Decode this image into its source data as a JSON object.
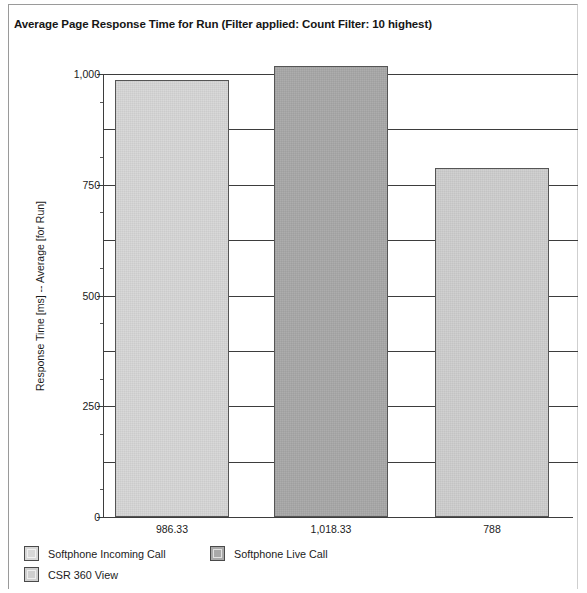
{
  "panel": {
    "title": "Average Page Response Time for Run (Filter applied: Count Filter: 10 highest)"
  },
  "chart_data": {
    "type": "bar",
    "title": "Average Page Response Time for Run (Filter applied: Count Filter: 10 highest)",
    "xlabel": "",
    "ylabel": "Response Time [ms] -- Average [for Run]",
    "categories": [
      "Softphone Incoming Call",
      "Softphone Live Call",
      "CSR 360 View"
    ],
    "values": [
      986.33,
      1018.33,
      788
    ],
    "value_labels": [
      "986.33",
      "1,018.33",
      "788"
    ],
    "colors": [
      "#d7d7d7",
      "#a9a9a9",
      "#cfcfcf"
    ],
    "ylim": [
      0,
      1062
    ],
    "y_ticks": [
      0,
      250,
      500,
      750,
      1000
    ],
    "y_tick_labels": [
      "0",
      "250",
      "500",
      "750",
      "1,000"
    ],
    "gridlines": [
      125,
      250,
      375,
      500,
      625,
      750,
      875,
      1000
    ],
    "minor_ticks": [
      62.5,
      187.5,
      312.5,
      437.5,
      562.5,
      687.5,
      812.5,
      937.5
    ],
    "grid": true,
    "legend_position": "bottom",
    "legend": [
      {
        "label": "Softphone Incoming Call",
        "color": "#d7d7d7"
      },
      {
        "label": "Softphone Live Call",
        "color": "#a9a9a9"
      },
      {
        "label": "CSR 360 View",
        "color": "#cfcfcf"
      }
    ]
  }
}
